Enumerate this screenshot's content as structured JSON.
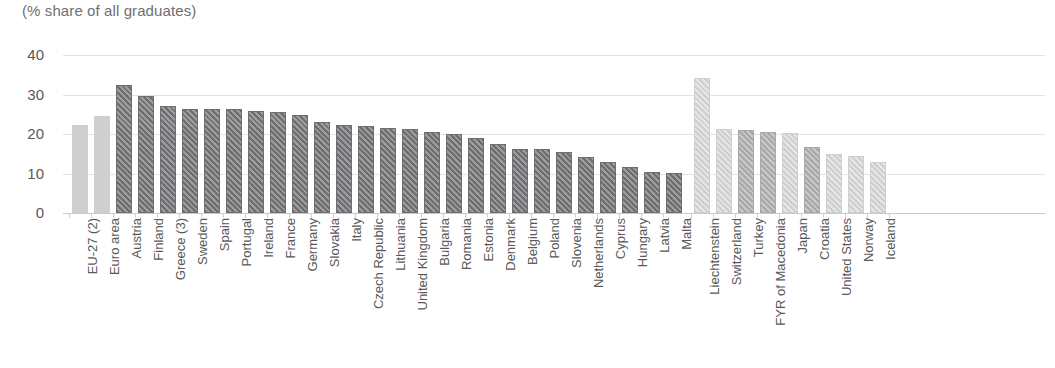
{
  "subtitle": "(% share of all graduates)",
  "axis": {
    "yticks": [
      "40",
      "30",
      "20",
      "10",
      "0"
    ]
  },
  "chart_data": {
    "type": "bar",
    "title": "(% share of all graduates)",
    "subtitle": "(% share of all graduates)",
    "xlabel": "",
    "ylabel": "",
    "ylim": [
      0,
      40
    ],
    "yticks": [
      0,
      10,
      20,
      30,
      40
    ],
    "grid": true,
    "legend": "none",
    "categories": [
      "EU-27 (2)",
      "Euro area",
      "Austria",
      "Finland",
      "Greece (3)",
      "Sweden",
      "Spain",
      "Portugal",
      "Ireland",
      "France",
      "Germany",
      "Slovakia",
      "Italy",
      "Czech Republic",
      "Lithuania",
      "United Kingdom",
      "Bulgaria",
      "Romania",
      "Estonia",
      "Denmark",
      "Belgium",
      "Poland",
      "Slovenia",
      "Netherlands",
      "Cyprus",
      "Hungary",
      "Latvia",
      "Malta",
      "Liechtenstein",
      "Switzerland",
      "Turkey",
      "FYR of Macedonia",
      "Japan",
      "Croatia",
      "United States",
      "Norway",
      "Iceland"
    ],
    "values": [
      22.3,
      24.5,
      32.4,
      29.5,
      27.2,
      26.4,
      26.4,
      26.3,
      25.7,
      25.6,
      24.8,
      23.1,
      22.3,
      21.9,
      21.4,
      21.2,
      20.6,
      19.9,
      19.1,
      17.5,
      16.2,
      16.3,
      15.5,
      14.3,
      13.0,
      11.7,
      10.5,
      10.1,
      34.1,
      21.3,
      21.0,
      20.4,
      20.2,
      16.6,
      15.0,
      14.4,
      13.0
    ],
    "styles": [
      "plain-light",
      "plain-light",
      "hatch-dark",
      "hatch-dark",
      "hatch-dark",
      "hatch-dark",
      "hatch-dark",
      "hatch-dark",
      "hatch-dark",
      "hatch-dark",
      "hatch-dark",
      "hatch-dark",
      "hatch-dark",
      "hatch-dark",
      "hatch-dark",
      "hatch-dark",
      "hatch-dark",
      "hatch-dark",
      "hatch-dark",
      "hatch-dark",
      "hatch-dark",
      "hatch-dark",
      "hatch-dark",
      "hatch-dark",
      "hatch-dark",
      "hatch-dark",
      "hatch-dark",
      "hatch-dark",
      "hatch-light",
      "hatch-light",
      "hatch-mid",
      "hatch-mid",
      "hatch-light",
      "hatch-mid",
      "hatch-light",
      "hatch-light",
      "hatch-light"
    ],
    "group_break_after_index": 27,
    "colors": {
      "aggregate_bar": "#cfcfcf",
      "member_state_bar": "#6e6e70",
      "non_member_bar": "#b5b5b6",
      "gridline": "#e3e3e3",
      "text": "#58585a"
    }
  }
}
